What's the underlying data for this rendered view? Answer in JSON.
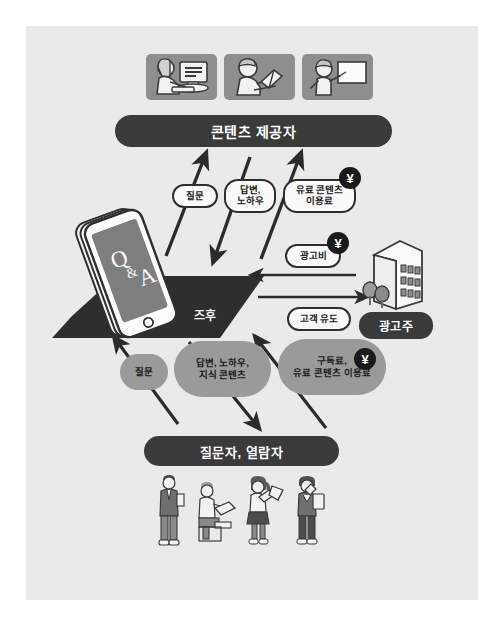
{
  "diagram": {
    "background_color": "#eaeaea",
    "dark_color": "#3a3a3a",
    "gray_color": "#9a9a9a",
    "tile_color": "#8e8e8e"
  },
  "top": {
    "tiles": [
      {
        "name": "person-at-computer",
        "label": ""
      },
      {
        "name": "person-reading-book",
        "label": ""
      },
      {
        "name": "person-at-whiteboard",
        "label": ""
      }
    ],
    "bar_label": "콘텐츠 제공자"
  },
  "platform": {
    "phone_text": "Q & A",
    "phone_text_q": "Q",
    "phone_text_amp": "&",
    "phone_text_a": "A",
    "label": "즈후"
  },
  "advertiser": {
    "label": "광고주",
    "building_name": "office-building"
  },
  "bottom": {
    "bar_label": "질문자, 열람자",
    "people": [
      {
        "name": "person-standing-suit"
      },
      {
        "name": "person-sitting-reading"
      },
      {
        "name": "person-woman-with-papers"
      },
      {
        "name": "person-with-documents"
      }
    ]
  },
  "flows": {
    "upper": [
      {
        "id": "question-up",
        "label": "질문",
        "paid": false,
        "direction": "up"
      },
      {
        "id": "answer-down",
        "label": "답변,\n노하우",
        "paid": false,
        "direction": "down"
      },
      {
        "id": "content-fee-up",
        "label": "유료 콘텐츠\n이용료",
        "paid": true,
        "direction": "up"
      }
    ],
    "upper_labels": {
      "question": "질문",
      "answer_line1": "답변,",
      "answer_line2": "노하우",
      "fee_line1": "유료 콘텐츠",
      "fee_line2": "이용료"
    },
    "middle": {
      "ad_fee_label": "광고비",
      "ad_fee_paid": true,
      "ad_fee_direction": "left",
      "customer_label": "고객 유도",
      "customer_direction": "right"
    },
    "lower_labels": {
      "question": "질문",
      "answer_line1": "답변, 노하우,",
      "answer_line2": "지식 콘텐츠",
      "fee_line1": "구독료,",
      "fee_line2": "유료 콘텐츠 이용료"
    },
    "lower_paid": true
  },
  "symbols": {
    "yen": "¥"
  }
}
